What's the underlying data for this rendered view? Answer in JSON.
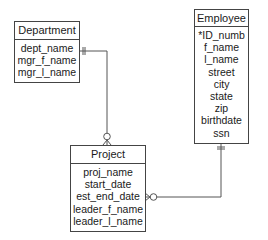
{
  "entities": {
    "department": {
      "title": "Department",
      "attributes": [
        "dept_name",
        "mgr_f_name",
        "mgr_l_name"
      ]
    },
    "employee": {
      "title": "Employee",
      "attributes": [
        "*ID_numb",
        "f_name",
        "l_name",
        "street",
        "city",
        "state",
        "zip",
        "birthdate",
        "ssn"
      ]
    },
    "project": {
      "title": "Project",
      "attributes": [
        "proj_name",
        "start_date",
        "est_end_date",
        "leader_f_name",
        "leader_l_name"
      ]
    }
  },
  "relationships": [
    {
      "from": "Department",
      "to": "Project",
      "from_cardinality": "one-and-only-one",
      "to_cardinality": "zero-or-many"
    },
    {
      "from": "Employee",
      "to": "Project",
      "from_cardinality": "one-and-only-one",
      "to_cardinality": "zero-or-many"
    }
  ],
  "colors": {
    "line": "#555555",
    "border": "#444444"
  }
}
